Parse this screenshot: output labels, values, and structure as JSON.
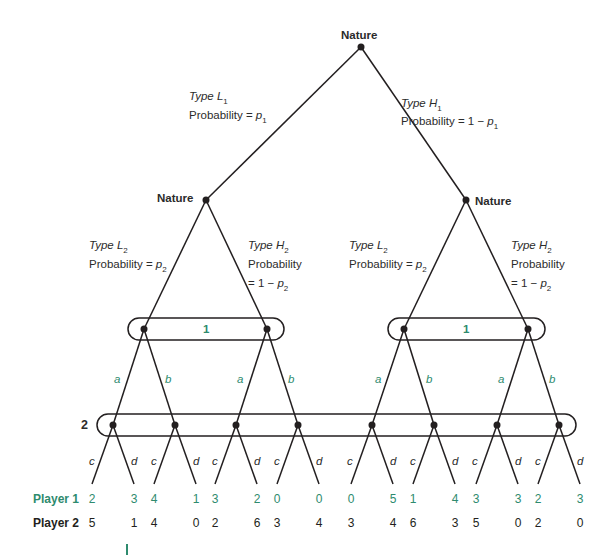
{
  "colors": {
    "player1": "#2e8b6e",
    "player2": "#231f20",
    "lines": "#231f20"
  },
  "nodes": {
    "root": {
      "label": "Nature",
      "x": 361,
      "y": 47
    },
    "nature_left": {
      "label": "Nature",
      "x": 206,
      "y": 200
    },
    "nature_right": {
      "label": "Nature",
      "x": 466,
      "y": 200
    }
  },
  "branches": {
    "type_l1": {
      "type": "Type L",
      "sub": "1",
      "prob_prefix": "Probability = ",
      "prob_var": "p",
      "prob_sub": "1"
    },
    "type_h1": {
      "type": "Type H",
      "sub": "1",
      "prob_prefix": "Probability = 1 − ",
      "prob_var": "p",
      "prob_sub": "1"
    },
    "left_l2": {
      "type": "Type L",
      "sub": "2",
      "prob_prefix": "Probability = ",
      "prob_var": "p",
      "prob_sub": "2"
    },
    "left_h2": {
      "type": "Type H",
      "sub": "2",
      "prob_line1": "Probability",
      "prob_prefix": "= 1 − ",
      "prob_var": "p",
      "prob_sub": "2"
    },
    "right_l2": {
      "type": "Type L",
      "sub": "2",
      "prob_prefix": "Probability = ",
      "prob_var": "p",
      "prob_sub": "2"
    },
    "right_h2": {
      "type": "Type H",
      "sub": "2",
      "prob_line1": "Probability",
      "prob_prefix": "= 1 − ",
      "prob_var": "p",
      "prob_sub": "2"
    }
  },
  "info_sets": {
    "player1_left": {
      "label": "1"
    },
    "player1_right": {
      "label": "1"
    },
    "player2": {
      "label": "2"
    }
  },
  "moves": {
    "player1": [
      "a",
      "b"
    ],
    "player2": [
      "c",
      "d"
    ]
  },
  "payoff_labels": {
    "player1": "Player 1",
    "player2": "Player 2"
  },
  "payoffs": {
    "player1": [
      "2",
      "3",
      "4",
      "1",
      "3",
      "2",
      "0",
      "0",
      "0",
      "5",
      "1",
      "4",
      "3",
      "3",
      "2",
      "3"
    ],
    "player2": [
      "5",
      "1",
      "4",
      "0",
      "2",
      "6",
      "3",
      "4",
      "3",
      "4",
      "6",
      "3",
      "5",
      "0",
      "2",
      "0"
    ]
  }
}
